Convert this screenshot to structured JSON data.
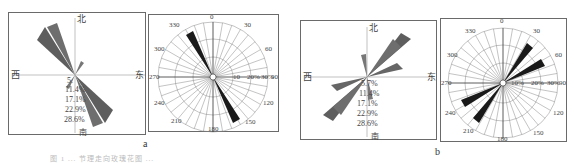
{
  "figure": {
    "caption": "图 1 ... 节理走向玫瑰花图 ...",
    "panels": [
      {
        "id": "a",
        "label": "a"
      },
      {
        "id": "b",
        "label": "b"
      }
    ]
  },
  "chart_data": [
    {
      "type": "rose",
      "panel": "a-left",
      "title": "",
      "direction_labels": {
        "north": "北",
        "south": "南",
        "east": "东",
        "west": "西"
      },
      "radial_tick_labels": [
        "5.",
        "11.4%",
        "17.1%",
        "22.9%",
        "28.6%"
      ],
      "radial_ticks": [
        5.7,
        11.4,
        17.1,
        22.9,
        28.6
      ],
      "dominant_directions": [
        {
          "azimuth": 315,
          "value": 28
        },
        {
          "azimuth": 325,
          "value": 24
        },
        {
          "azimuth": 135,
          "value": 28
        },
        {
          "azimuth": 145,
          "value": 24
        },
        {
          "azimuth": 20,
          "value": 6
        },
        {
          "azimuth": 200,
          "value": 6
        }
      ]
    },
    {
      "type": "rose",
      "panel": "a-right",
      "angle_labels": [
        "0",
        "30",
        "60",
        "90",
        "120",
        "150",
        "180",
        "210",
        "240",
        "270",
        "300",
        "330"
      ],
      "radial_tick_labels": [
        "10",
        "20%",
        "30%"
      ],
      "radial_ticks": [
        10,
        20,
        30
      ],
      "bars": [
        {
          "azimuth": 330,
          "value": 24
        },
        {
          "azimuth": 150,
          "value": 24
        }
      ]
    },
    {
      "type": "rose",
      "panel": "b-left",
      "direction_labels": {
        "north": "北",
        "south": "南",
        "east": "东",
        "west": "西"
      },
      "radial_tick_labels": [
        "5.7%",
        "11.4%",
        "17.1%",
        "22.9%",
        "28.6%"
      ],
      "radial_ticks": [
        5.7,
        11.4,
        17.1,
        22.9,
        28.6
      ],
      "dominant_directions": [
        {
          "azimuth": 45,
          "value": 28
        },
        {
          "azimuth": 55,
          "value": 24
        },
        {
          "azimuth": 225,
          "value": 28
        },
        {
          "azimuth": 235,
          "value": 24
        },
        {
          "azimuth": 5,
          "value": 10
        },
        {
          "azimuth": 185,
          "value": 10
        }
      ]
    },
    {
      "type": "rose",
      "panel": "b-right",
      "angle_labels": [
        "0",
        "30",
        "60",
        "90",
        "120",
        "150",
        "180",
        "210",
        "240",
        "270",
        "300",
        "330"
      ],
      "radial_tick_labels": [
        "10%",
        "20%",
        "30%"
      ],
      "radial_ticks": [
        10,
        20,
        30
      ],
      "bars": [
        {
          "azimuth": 35,
          "value": 26
        },
        {
          "azimuth": 60,
          "value": 24
        },
        {
          "azimuth": 215,
          "value": 26
        },
        {
          "azimuth": 240,
          "value": 24
        }
      ]
    }
  ]
}
